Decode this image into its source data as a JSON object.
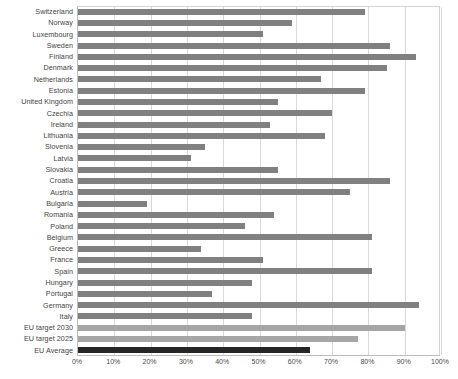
{
  "chart_data": {
    "type": "bar",
    "orientation": "horizontal",
    "title": "",
    "subtitle": "",
    "xlabel": "",
    "ylabel": "",
    "xlim": [
      0,
      100
    ],
    "xtick_labels": [
      "0%",
      "10%",
      "20%",
      "30%",
      "40%",
      "50%",
      "60%",
      "70%",
      "80%",
      "90%",
      "100%"
    ],
    "xtick_values": [
      0,
      10,
      20,
      30,
      40,
      50,
      60,
      70,
      80,
      90,
      100
    ],
    "grid": "vertical",
    "legend": "none",
    "unit": "%",
    "categories": [
      "Switzerland",
      "Norway",
      "Luxembourg",
      "Sweden",
      "Finland",
      "Denmark",
      "Netherlands",
      "Estonia",
      "United Kingdom",
      "Czechia",
      "Ireland",
      "Lithuania",
      "Slovenia",
      "Latvia",
      "Slovakia",
      "Croatia",
      "Austria",
      "Bulgaria",
      "Romania",
      "Poland",
      "Belgium",
      "Greece",
      "France",
      "Spain",
      "Hungary",
      "Portugal",
      "Germany",
      "Italy",
      "EU target 2030",
      "EU target 2025",
      "EU Average"
    ],
    "values": [
      79,
      59,
      51,
      86,
      93,
      85,
      67,
      79,
      55,
      70,
      53,
      68,
      35,
      31,
      55,
      86,
      75,
      19,
      54,
      46,
      81,
      34,
      51,
      81,
      48,
      37,
      94,
      48,
      90,
      77,
      64
    ],
    "series_groups": [
      {
        "name": "country",
        "color": "#808080",
        "indices_from": 0,
        "indices_to": 27
      },
      {
        "name": "eu-target",
        "color": "#a6a6a6",
        "indices_from": 28,
        "indices_to": 29
      },
      {
        "name": "eu-average",
        "color": "#262626",
        "indices_from": 30,
        "indices_to": 30
      }
    ],
    "colors": {
      "bar": "#808080",
      "target_bar": "#a6a6a6",
      "average_bar": "#262626",
      "gridline": "#d9d9d9",
      "axis": "#bdbdbd",
      "text": "#3f3f3f",
      "background": "#ffffff"
    }
  }
}
